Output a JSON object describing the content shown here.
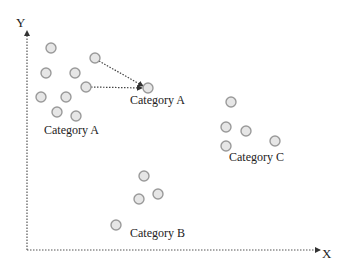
{
  "diagram": {
    "axes": {
      "y_label": "Y",
      "x_label": "X",
      "origin": [
        27,
        250
      ],
      "y_top": 31,
      "x_right": 320,
      "color": "#555555"
    },
    "point_style": {
      "radius": 5,
      "fill": "#e6e6e6",
      "stroke": "#9a9a9a"
    },
    "groups": [
      {
        "name": "Category A",
        "label": "Category A",
        "label_pos": [
          44,
          134
        ],
        "points": [
          [
            51,
            48
          ],
          [
            46,
            73
          ],
          [
            75,
            73
          ],
          [
            41,
            97
          ],
          [
            66,
            97
          ],
          [
            57,
            112
          ],
          [
            76,
            116
          ],
          [
            95,
            58
          ],
          [
            86,
            87
          ]
        ]
      },
      {
        "name": "Category A (moved)",
        "label": "Category A",
        "label_pos": [
          130,
          104
        ],
        "points": [
          [
            148,
            88
          ]
        ]
      },
      {
        "name": "Category C",
        "label": "Category C",
        "label_pos": [
          229,
          161
        ],
        "points": [
          [
            231,
            102
          ],
          [
            226,
            127
          ],
          [
            246,
            131
          ],
          [
            226,
            146
          ],
          [
            275,
            141
          ]
        ]
      },
      {
        "name": "Category B",
        "label": "Category B",
        "label_pos": [
          130,
          237
        ],
        "points": [
          [
            144,
            176
          ],
          [
            139,
            199
          ],
          [
            158,
            194
          ],
          [
            116,
            225
          ]
        ]
      }
    ],
    "arrows": [
      {
        "from": [
          99,
          61
        ],
        "to": [
          143,
          86
        ]
      },
      {
        "from": [
          91,
          87
        ],
        "to": [
          142,
          88
        ]
      }
    ]
  }
}
